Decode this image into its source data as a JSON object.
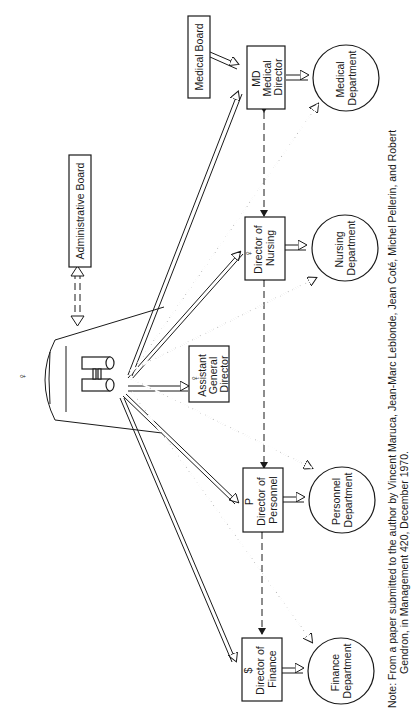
{
  "diagram": {
    "title_rotated": true,
    "center": {
      "name": "General Director",
      "symbol": "♀",
      "icon": "binoculars-icon"
    },
    "boards": [
      {
        "id": "admin_board",
        "label": "Administrative Board"
      },
      {
        "id": "medical_board",
        "label": "Medical Board"
      }
    ],
    "directors": [
      {
        "id": "md",
        "symbol": "MD",
        "lines": [
          "Medical",
          "Director"
        ]
      },
      {
        "id": "nursing",
        "symbol": "♀",
        "lines": [
          "Director of",
          "Nursing"
        ]
      },
      {
        "id": "assistant",
        "symbol": "♀",
        "lines": [
          "Assistant",
          "General",
          "Director"
        ]
      },
      {
        "id": "personnel",
        "symbol": "P",
        "lines": [
          "Director of",
          "Personnel"
        ]
      },
      {
        "id": "finance",
        "symbol": "$",
        "lines": [
          "Director of",
          "Finance"
        ]
      }
    ],
    "departments": [
      {
        "id": "medical_dept",
        "lines": [
          "Medical",
          "Department"
        ]
      },
      {
        "id": "nursing_dept",
        "lines": [
          "Nursing",
          "Department"
        ]
      },
      {
        "id": "personnel_dept",
        "lines": [
          "Personnel",
          "Department"
        ]
      },
      {
        "id": "finance_dept",
        "lines": [
          "Finance",
          "Department"
        ]
      }
    ],
    "legend_colors": {
      "ink": "#1a1a1a",
      "paper": "#ffffff"
    }
  },
  "note": {
    "line1": "Note: From a paper submitted to the author by Vincent Maruca, Jean-Marc Leblonde, Jean Coté, Michel Pellerin, and Robert",
    "line2": "Gendron, in Management 420, December 1970."
  }
}
